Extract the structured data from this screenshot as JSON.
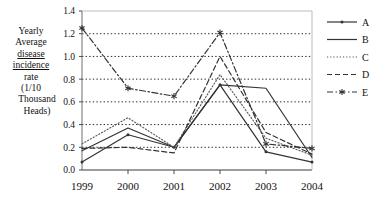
{
  "chart_data": {
    "type": "line",
    "title": "",
    "xlabel": "",
    "ylabel": "Yearly Average disease incidence rate (1/10 Thousand Heads)",
    "ylabel_lines": [
      "Yearly",
      "Average",
      "disease",
      "incidence",
      "rate",
      "(1/10",
      "Thousand",
      "Heads)"
    ],
    "categories": [
      "1999",
      "2000",
      "2001",
      "2002",
      "2003",
      "2004"
    ],
    "x": [
      1999,
      2000,
      2001,
      2002,
      2003,
      2004
    ],
    "ylim": [
      0.0,
      1.4
    ],
    "yticks": [
      "0.0",
      "0.2",
      "0.4",
      "0.6",
      "0.8",
      "1.0",
      "1.2",
      "1.4"
    ],
    "ytick_values": [
      0.0,
      0.2,
      0.4,
      0.6,
      0.8,
      1.0,
      1.2,
      1.4
    ],
    "grid": "horizontal-dotted",
    "legend_position": "right",
    "series": [
      {
        "name": "A",
        "style": "solid-marker",
        "marker": "dot",
        "color": "#333333",
        "values": [
          0.07,
          0.31,
          0.2,
          0.75,
          0.16,
          0.07
        ]
      },
      {
        "name": "B",
        "style": "solid",
        "marker": "none",
        "color": "#333333",
        "values": [
          0.17,
          0.37,
          0.2,
          0.75,
          0.72,
          0.11
        ]
      },
      {
        "name": "C",
        "style": "dotted",
        "marker": "none",
        "color": "#555555",
        "values": [
          0.23,
          0.46,
          0.2,
          0.84,
          0.28,
          0.13
        ]
      },
      {
        "name": "D",
        "style": "dashed",
        "marker": "none",
        "color": "#333333",
        "values": [
          0.19,
          0.2,
          0.15,
          1.0,
          0.33,
          0.14
        ]
      },
      {
        "name": "E",
        "style": "dash-dot-marker",
        "marker": "asterisk",
        "color": "#333333",
        "values": [
          1.25,
          0.72,
          0.65,
          1.21,
          0.23,
          0.19
        ]
      }
    ]
  },
  "legend": {
    "items": [
      {
        "label": "A"
      },
      {
        "label": "B"
      },
      {
        "label": "C"
      },
      {
        "label": "D"
      },
      {
        "label": "E"
      }
    ]
  }
}
